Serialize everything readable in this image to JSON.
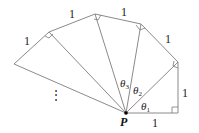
{
  "diagram": {
    "point_label": "P",
    "unit_labels": [
      "1",
      "1",
      "1",
      "1",
      "1",
      "1"
    ],
    "angle_labels": [
      {
        "symbol": "θ",
        "subscript": "1"
      },
      {
        "symbol": "θ",
        "subscript": "2"
      },
      {
        "symbol": "θ",
        "subscript": "3"
      }
    ],
    "continuation": "⋮",
    "colors": {
      "line": "#8a8a8a",
      "text": "#222222",
      "point": "#000000"
    }
  }
}
